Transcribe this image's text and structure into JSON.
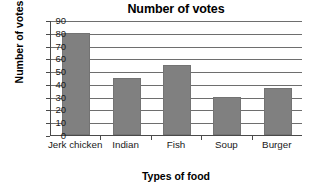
{
  "chart_data": {
    "type": "bar",
    "title": "Number of votes",
    "xlabel": "Types of food",
    "ylabel": "Number of votes",
    "categories": [
      "Jerk chicken",
      "Indian",
      "Fish",
      "Soup",
      "Burger"
    ],
    "values": [
      80,
      45,
      55,
      30,
      37
    ],
    "ylim": [
      0,
      90
    ],
    "ytick_step": 10,
    "yticks": [
      "90",
      "80",
      "70",
      "60",
      "50",
      "40",
      "30",
      "20",
      "10",
      "0"
    ],
    "grid": true,
    "legend": false,
    "series_color": "#808080",
    "axis_color": "#4a4a4a",
    "background": "#ffffff"
  }
}
